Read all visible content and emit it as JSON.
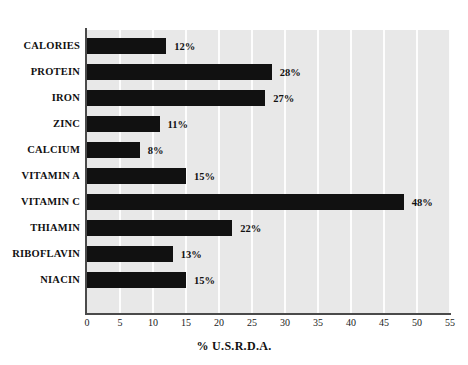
{
  "chart_data": {
    "type": "bar",
    "orientation": "horizontal",
    "title": "",
    "xlabel": "% U.S.R.D.A.",
    "ylabel": "",
    "xlim": [
      0,
      55
    ],
    "xticks": [
      0,
      5,
      10,
      15,
      20,
      25,
      30,
      35,
      40,
      45,
      50,
      55
    ],
    "xtick_labels": [
      "0",
      "5",
      "10",
      "15",
      "20",
      "25",
      "30",
      "35",
      "40",
      "45",
      "50",
      "55"
    ],
    "grid": "vertical",
    "legend": "none",
    "categories": [
      "CALORIES",
      "PROTEIN",
      "IRON",
      "ZINC",
      "CALCIUM",
      "VITAMIN A",
      "VITAMIN C",
      "THIAMIN",
      "RIBOFLAVIN",
      "NIACIN"
    ],
    "values": [
      12,
      28,
      27,
      11,
      8,
      15,
      48,
      22,
      13,
      15
    ],
    "value_labels": [
      "12%",
      "28%",
      "27%",
      "11%",
      "8%",
      "15%",
      "48%",
      "22%",
      "13%",
      "15%"
    ],
    "colors": {
      "bar": "#111111",
      "plot_background": "#e8e8e8",
      "gridline": "#fdfdfd",
      "axis": "#4a4a4a",
      "text": "#111111",
      "page_background": "#ffffff"
    }
  }
}
